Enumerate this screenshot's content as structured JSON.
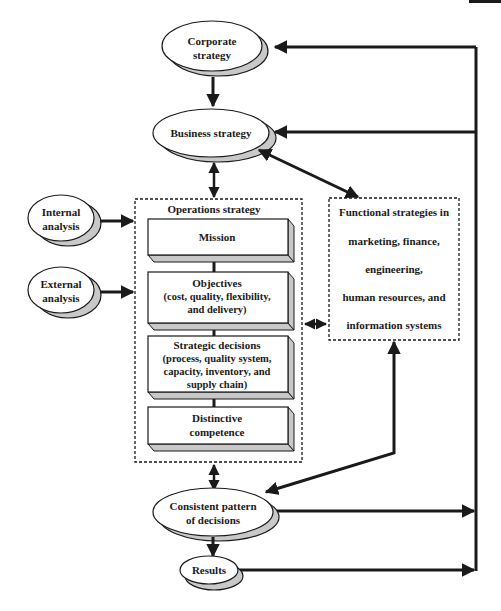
{
  "header": {
    "page_header_fragment": "",
    "corner_tab_color": "#1a1a1a"
  },
  "colors": {
    "line": "#1a1a1a",
    "shadow": "#c8c8c8",
    "fill": "#ffffff",
    "text": "#1a1a1a"
  },
  "nodes": {
    "corporate_strategy": {
      "line1": "Corporate",
      "line2": "strategy"
    },
    "business_strategy": {
      "label": "Business strategy"
    },
    "internal_analysis": {
      "line1": "Internal",
      "line2": "analysis"
    },
    "external_analysis": {
      "line1": "External",
      "line2": "analysis"
    },
    "operations_strategy": {
      "title": "Operations strategy",
      "boxes": [
        {
          "lines": [
            "Mission"
          ]
        },
        {
          "lines": [
            "Objectives",
            "(cost, quality, flexibility,",
            "and delivery)"
          ]
        },
        {
          "lines": [
            "Strategic decisions",
            "(process, quality system,",
            "capacity, inventory, and",
            "supply chain)"
          ]
        },
        {
          "lines": [
            "Distinctive",
            "competence"
          ]
        }
      ]
    },
    "functional_strategies": {
      "lines": [
        "Functional strategies in",
        "marketing, finance,",
        "engineering,",
        "human resources, and",
        "information systems"
      ]
    },
    "consistent_pattern": {
      "line1": "Consistent pattern",
      "line2": "of decisions"
    },
    "results": {
      "label": "Results"
    }
  }
}
